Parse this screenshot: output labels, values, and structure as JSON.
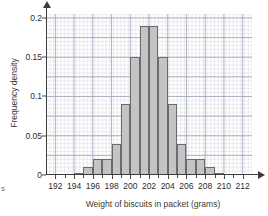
{
  "stray_text": "s",
  "chart_data": {
    "type": "bar",
    "title": "",
    "xlabel": "Weight of biscuits in packet (grams)",
    "ylabel": "Frequency density",
    "xlim": [
      191,
      213
    ],
    "ylim": [
      0,
      0.205
    ],
    "xtick_labels": [
      "192",
      "194",
      "196",
      "198",
      "200",
      "202",
      "204",
      "206",
      "208",
      "210",
      "212"
    ],
    "xticks": [
      192,
      194,
      196,
      198,
      200,
      202,
      204,
      206,
      208,
      210,
      212
    ],
    "ytick_labels": [
      "0",
      "0.05",
      "0.1",
      "0.15",
      "0.2"
    ],
    "yticks": [
      0,
      0.05,
      0.1,
      0.15,
      0.2
    ],
    "grid": "major and minor grid shown",
    "legend": "none",
    "bin_width": 1,
    "bin_edges": [
      194,
      195,
      196,
      197,
      198,
      199,
      200,
      201,
      202,
      203,
      204,
      205,
      206,
      207,
      208,
      209,
      210
    ],
    "bin_starts": [
      194,
      195,
      196,
      197,
      198,
      199,
      200,
      201,
      202,
      203,
      204,
      205,
      206,
      207,
      208,
      209
    ],
    "values": [
      0.003,
      0.01,
      0.02,
      0.02,
      0.04,
      0.09,
      0.15,
      0.19,
      0.19,
      0.15,
      0.09,
      0.04,
      0.02,
      0.01,
      0.003,
      0.003
    ],
    "bars": [
      {
        "start": 194,
        "end": 195,
        "value": 0.003
      },
      {
        "start": 195,
        "end": 196,
        "value": 0.01
      },
      {
        "start": 196,
        "end": 197,
        "value": 0.02
      },
      {
        "start": 197,
        "end": 198,
        "value": 0.02
      },
      {
        "start": 198,
        "end": 199,
        "value": 0.04
      },
      {
        "start": 199,
        "end": 200,
        "value": 0.09
      },
      {
        "start": 200,
        "end": 201,
        "value": 0.15
      },
      {
        "start": 201,
        "end": 202,
        "value": 0.19
      },
      {
        "start": 202,
        "end": 203,
        "value": 0.19
      },
      {
        "start": 203,
        "end": 204,
        "value": 0.15
      },
      {
        "start": 204,
        "end": 205,
        "value": 0.09
      },
      {
        "start": 205,
        "end": 206,
        "value": 0.04
      },
      {
        "start": 206,
        "end": 207,
        "value": 0.02
      },
      {
        "start": 207,
        "end": 208,
        "value": 0.02
      },
      {
        "start": 208,
        "end": 209,
        "value": 0.01
      },
      {
        "start": 209,
        "end": 210,
        "value": 0.003
      }
    ],
    "bar_fill_color": "#c4c4c4",
    "bar_edge_color": "#6b6b6b",
    "grid_major_color": "#9aa3b4",
    "grid_minor_color": "#d8d8e2",
    "axis_color": "#3d3d3d"
  }
}
